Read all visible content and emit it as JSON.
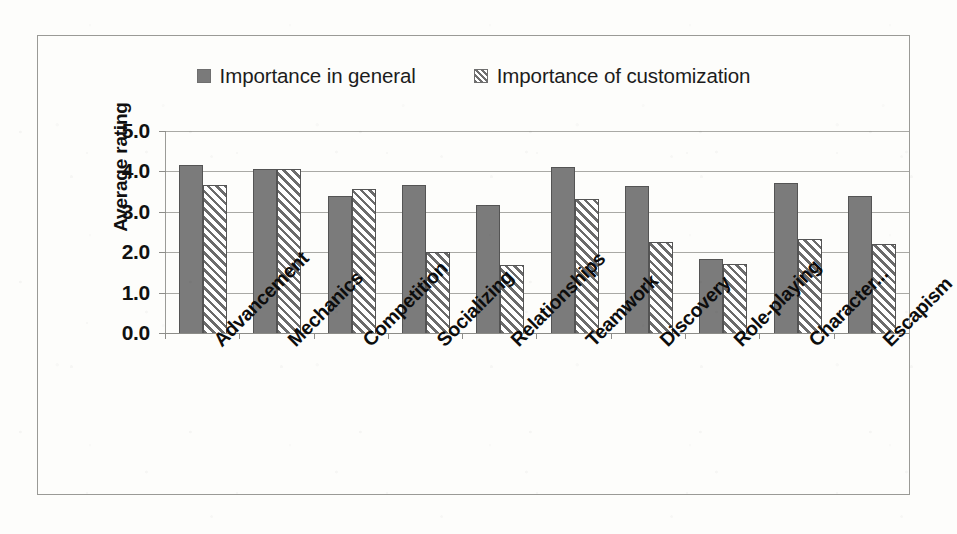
{
  "chart_data": {
    "type": "bar",
    "title": "",
    "xlabel": "",
    "ylabel": "Average rating",
    "ylim": [
      0,
      5
    ],
    "ytick_step": 1,
    "ytick_labels": [
      "5.0",
      "4.0",
      "3.0",
      "2.0",
      "1.0",
      "0.0"
    ],
    "ytick_values": [
      5.0,
      4.0,
      3.0,
      2.0,
      1.0,
      0.0
    ],
    "grid": true,
    "legend_position": "top-center",
    "categories": [
      "Advancement",
      "Mechanics",
      "Competition",
      "Socializing",
      "Relationships",
      "Teamwork",
      "Discovery",
      "Role-playing",
      "Character...",
      "Escapism"
    ],
    "series": [
      {
        "name": "Importance in general",
        "pattern": "solid",
        "color": "#7b7b7b",
        "values": [
          4.15,
          4.07,
          3.38,
          3.67,
          3.18,
          4.1,
          3.63,
          1.82,
          3.72,
          3.4
        ]
      },
      {
        "name": "Importance of customization",
        "pattern": "diagonal-hatch",
        "color": "#6b6b6b",
        "values": [
          3.66,
          4.05,
          3.57,
          2.0,
          1.68,
          3.32,
          2.25,
          1.7,
          2.32,
          2.2
        ]
      }
    ]
  },
  "legend": {
    "entries": [
      {
        "label": "Importance in general",
        "swatch": "solid-square-icon"
      },
      {
        "label": "Importance of customization",
        "swatch": "hatched-square-icon"
      }
    ]
  },
  "colors": {
    "series_solid": "#7b7b7b",
    "series_hatch": "#6b6b6b",
    "gridline": "#a9a9a5",
    "frame": "#9a9a96",
    "text": "#101010",
    "background": "#fdfdfb"
  }
}
